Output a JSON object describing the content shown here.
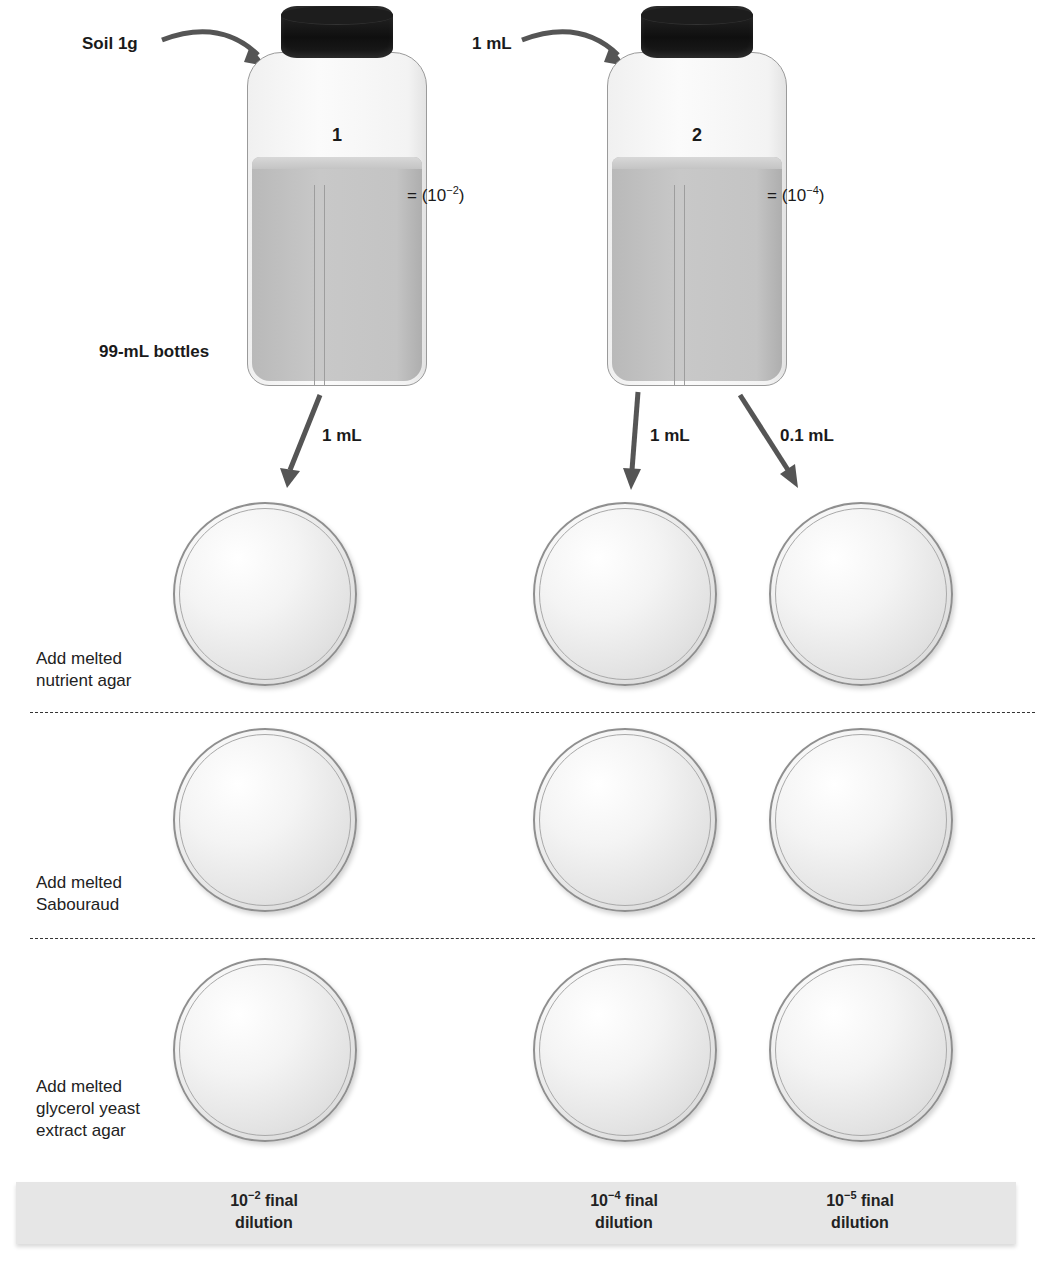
{
  "inputs": {
    "soil_label": "Soil 1g",
    "transfer_label": "1 mL"
  },
  "bottles": [
    {
      "number": "1",
      "dilution_prefix": "= (10",
      "dilution_exp": "−2",
      "dilution_suffix": ")"
    },
    {
      "number": "2",
      "dilution_prefix": "= (10",
      "dilution_exp": "−4",
      "dilution_suffix": ")"
    }
  ],
  "bottle_size_label": "99-mL bottles",
  "transfers": [
    {
      "label": "1 mL",
      "from": "bottle 1"
    },
    {
      "label": "1 mL",
      "from": "bottle 2"
    },
    {
      "label": "0.1 mL",
      "from": "bottle 2"
    }
  ],
  "rows": [
    {
      "label_line1": "Add melted",
      "label_line2": "nutrient agar",
      "label_line3": ""
    },
    {
      "label_line1": "Add melted",
      "label_line2": "Sabouraud",
      "label_line3": ""
    },
    {
      "label_line1": "Add melted",
      "label_line2": "glycerol yeast",
      "label_line3": "extract agar"
    }
  ],
  "final_dilutions": [
    {
      "base": "10",
      "exp": "−2",
      "line1_suffix": " final",
      "line2": "dilution"
    },
    {
      "base": "10",
      "exp": "−4",
      "line1_suffix": " final",
      "line2": "dilution"
    },
    {
      "base": "10",
      "exp": "−5",
      "line1_suffix": " final",
      "line2": "dilution"
    }
  ],
  "colors": {
    "arrow": "#555555",
    "cap": "#111111",
    "liquid": "#c2c2c2",
    "footer_band": "#e6e6e6"
  }
}
